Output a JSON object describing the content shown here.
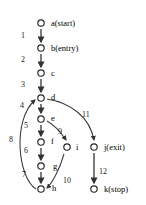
{
  "figure": {
    "type": "directed-graph",
    "title": "",
    "background_color": "#ffffff",
    "node_color": "#ffffff",
    "node_stroke_color": "#262626",
    "edge_color": "#3a3a3a"
  },
  "nodes": [
    {
      "id": "a",
      "label": "a(start)",
      "x": 41,
      "y": 23,
      "label_x": 51,
      "label_y": 19
    },
    {
      "id": "b",
      "label": "b(entry)",
      "x": 41,
      "y": 48,
      "label_x": 51,
      "label_y": 44
    },
    {
      "id": "c",
      "label": "c",
      "x": 41,
      "y": 73,
      "label_x": 51,
      "label_y": 69
    },
    {
      "id": "d",
      "label": "d",
      "x": 41,
      "y": 98,
      "label_x": 51,
      "label_y": 93
    },
    {
      "id": "e",
      "label": "e",
      "x": 41,
      "y": 119,
      "label_x": 51,
      "label_y": 114
    },
    {
      "id": "f",
      "label": "f",
      "x": 41,
      "y": 142,
      "label_x": 51,
      "label_y": 137
    },
    {
      "id": "g",
      "label": "g",
      "x": 41,
      "y": 166,
      "label_x": 53,
      "label_y": 162
    },
    {
      "id": "h",
      "label": "h",
      "x": 41,
      "y": 189,
      "label_x": 52,
      "label_y": 184
    },
    {
      "id": "i",
      "label": "i",
      "x": 67,
      "y": 147,
      "label_x": 76,
      "label_y": 143
    },
    {
      "id": "j",
      "label": "j(exit)",
      "x": 94,
      "y": 147,
      "label_x": 104,
      "label_y": 143
    },
    {
      "id": "k",
      "label": "k(stop)",
      "x": 94,
      "y": 189,
      "label_x": 104,
      "label_y": 185
    }
  ],
  "edges": [
    {
      "id": "e1",
      "label": "1",
      "from": "a",
      "to": "b",
      "label_x": 21,
      "label_y": 32,
      "path": "M 41 29 L 41 42",
      "shape": "straight"
    },
    {
      "id": "e2",
      "label": "2",
      "from": "b",
      "to": "c",
      "label_x": 21,
      "label_y": 56,
      "path": "M 41 54 L 41 67",
      "shape": "straight"
    },
    {
      "id": "e3",
      "label": "3",
      "from": "c",
      "to": "d",
      "label_x": 21,
      "label_y": 81,
      "path": "M 41 79 L 41 92",
      "shape": "straight"
    },
    {
      "id": "e4",
      "label": "4",
      "from": "d",
      "to": "e",
      "label_x": 20,
      "label_y": 102,
      "path": "M 41 104 L 41 113",
      "shape": "straight"
    },
    {
      "id": "e5",
      "label": "5",
      "from": "e",
      "to": "f",
      "label_x": 24,
      "label_y": 122,
      "path": "M 41 125 L 41 136",
      "shape": "straight"
    },
    {
      "id": "e6",
      "label": "6",
      "from": "f",
      "to": "g",
      "label_x": 24,
      "label_y": 147,
      "path": "M 41 148 L 41 160",
      "shape": "straight"
    },
    {
      "id": "e7",
      "label": "7",
      "from": "g",
      "to": "h",
      "label_x": 22,
      "label_y": 171,
      "path": "M 41 172 L 41 183",
      "shape": "straight"
    },
    {
      "id": "e8",
      "label": "8",
      "from": "h",
      "to": "d",
      "label_x": 9,
      "label_y": 136,
      "path": "M 36 189 C 18 178, 12 120, 35 100",
      "shape": "curve-left"
    },
    {
      "id": "e9",
      "label": "9",
      "from": "e",
      "to": "i",
      "label_x": 58,
      "label_y": 128,
      "path": "M 47 121 C 56 126, 62 134, 66 140",
      "shape": "curve-right"
    },
    {
      "id": "e10",
      "label": "10",
      "from": "i",
      "to": "h",
      "label_x": 63,
      "label_y": 177,
      "path": "M 64 154 C 60 168, 53 182, 47 188",
      "shape": "curve-left"
    },
    {
      "id": "e11",
      "label": "11",
      "from": "d",
      "to": "j",
      "label_x": 82,
      "label_y": 111,
      "path": "M 47 99 C 72 103, 90 118, 94 140",
      "shape": "curve-right"
    },
    {
      "id": "e12",
      "label": "12",
      "from": "j",
      "to": "k",
      "label_x": 99,
      "label_y": 168,
      "path": "M 94 153 L 94 183",
      "shape": "straight"
    }
  ]
}
